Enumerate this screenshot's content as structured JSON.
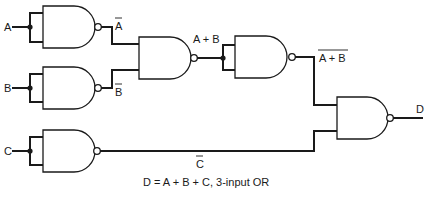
{
  "diagram": {
    "type": "logic-circuit",
    "inputs": [
      {
        "name": "A",
        "label": "A"
      },
      {
        "name": "B",
        "label": "B"
      },
      {
        "name": "C",
        "label": "C"
      }
    ],
    "signals": {
      "a_bar": {
        "label": "A",
        "overline": true
      },
      "b_bar": {
        "label": "B",
        "overline": true
      },
      "a_or_b": {
        "label": "A + B",
        "overline": false
      },
      "not_a_or_b": {
        "label": "A + B",
        "overline": true
      },
      "c_bar": {
        "label": "C",
        "overline": true
      }
    },
    "output": {
      "name": "D",
      "label": "D"
    },
    "gates": [
      {
        "id": "nand-a",
        "type": "NAND",
        "inputs": [
          "A",
          "A"
        ],
        "output": "a_bar"
      },
      {
        "id": "nand-b",
        "type": "NAND",
        "inputs": [
          "B",
          "B"
        ],
        "output": "b_bar"
      },
      {
        "id": "nand-ab",
        "type": "NAND",
        "inputs": [
          "a_bar",
          "b_bar"
        ],
        "output": "a_or_b"
      },
      {
        "id": "nand-inv-ab",
        "type": "NAND",
        "inputs": [
          "a_or_b",
          "a_or_b"
        ],
        "output": "not_a_or_b"
      },
      {
        "id": "nand-c",
        "type": "NAND",
        "inputs": [
          "C",
          "C"
        ],
        "output": "c_bar"
      },
      {
        "id": "nand-out",
        "type": "NAND",
        "inputs": [
          "not_a_or_b",
          "c_bar"
        ],
        "output": "D"
      }
    ],
    "caption": "D = A + B + C, 3-input OR"
  }
}
